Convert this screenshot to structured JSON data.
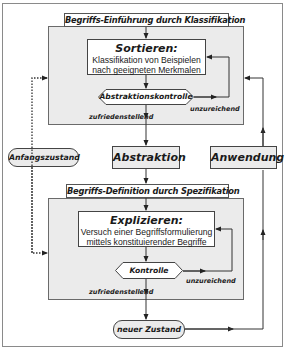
{
  "diagram": {
    "phase1": {
      "header": "Begriffs-Einführung durch Klassifikation",
      "step_title": "Sortieren:",
      "step_line1": "Klassifikation von Beispielen",
      "step_line2": "nach geeigneten Merkmalen",
      "check": "Abstraktionskontrolle",
      "fail_label": "unzureichend",
      "pass_label": "zufriedenstellend"
    },
    "middle": {
      "start_state": "Anfangszustand",
      "abstraction": "Abstraktion",
      "application": "Anwendung"
    },
    "phase2": {
      "header": "Begriffs-Definition durch Spezifikation",
      "step_title": "Explizieren:",
      "step_line1": "Versuch einer Begriffsformulierung",
      "step_line2": "mittels konstituierender Begriffe",
      "check": "Kontrolle",
      "fail_label": "unzureichend",
      "pass_label": "zufriedenstellend"
    },
    "end_state": "neuer Zustand",
    "colors": {
      "panel": "#ebebeb",
      "line": "#333333",
      "box": "#ffffff"
    }
  }
}
